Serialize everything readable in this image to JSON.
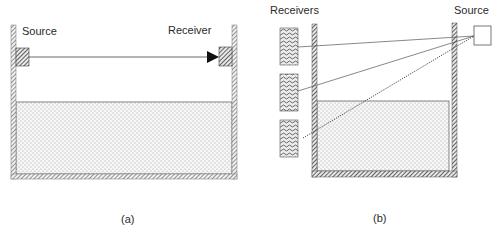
{
  "figure": {
    "panel_a": {
      "caption": "(a)",
      "labels": {
        "source": "Source",
        "receiver": "Receiver"
      },
      "elements": {
        "tank": "hatched-wall container with stippled liquid",
        "source_transducer": "hatched block on left wall",
        "receiver_transducer": "hatched block on right wall",
        "signal_path": "solid arrow from source to receiver across air gap"
      }
    },
    "panel_b": {
      "caption": "(b)",
      "labels": {
        "receivers": "Receivers",
        "source": "Source"
      },
      "receiver_count": 3,
      "elements": {
        "tank": "hatched-wall container with stippled liquid",
        "source_box": "open square outside right wall",
        "paths": [
          "solid line to receiver 1",
          "solid line to receiver 2",
          "dotted line to receiver 3 through liquid"
        ]
      }
    }
  },
  "colors": {
    "line": "#333333",
    "hatch": "#555555",
    "stipple": "#9a9a9a",
    "background": "#ffffff"
  }
}
